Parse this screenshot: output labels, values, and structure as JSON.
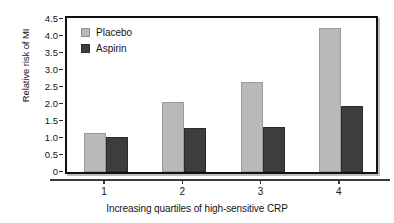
{
  "chart_data": {
    "type": "bar",
    "title": "",
    "xlabel": "Increasing quartiles of high-sensitive CRP",
    "ylabel": "Relative risk of MI",
    "categories": [
      "1",
      "2",
      "3",
      "4"
    ],
    "series": [
      {
        "name": "Placebo",
        "color": "#b9b9b9",
        "values": [
          1.14,
          2.06,
          2.66,
          4.25
        ]
      },
      {
        "name": "Aspirin",
        "color": "#3d3d3d",
        "values": [
          1.02,
          1.29,
          1.32,
          1.94
        ]
      }
    ],
    "ylim": [
      0,
      4.5
    ],
    "yticks": [
      "4.5",
      "4.0",
      "3.5",
      "3.0",
      "2.5",
      "2.0",
      "1.5",
      "1.0",
      "0.5",
      "0"
    ],
    "ytick_values": [
      4.5,
      4.0,
      3.5,
      3.0,
      2.5,
      2.0,
      1.5,
      1.0,
      0.5,
      0
    ],
    "grid": false,
    "legend_position": "top-left"
  }
}
